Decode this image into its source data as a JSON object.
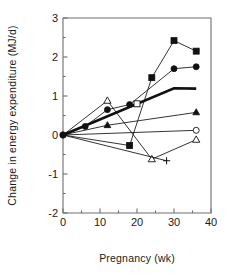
{
  "chart_data": {
    "type": "line",
    "title": "",
    "xlabel": "Pregnancy   (wk)",
    "ylabel": "Change in energy expenditure (MJ/d)",
    "xlim": [
      0,
      40
    ],
    "ylim": [
      -2,
      3
    ],
    "xticks": [
      0,
      10,
      20,
      30,
      40
    ],
    "xtick_labels": [
      "0",
      "10",
      "20",
      "30",
      "40"
    ],
    "xminor_ticks": [
      5,
      15,
      25,
      35
    ],
    "yticks": [
      -2,
      -1,
      0,
      1,
      2,
      3
    ],
    "ytick_labels": [
      "-2",
      "-1",
      "0",
      "1",
      "2",
      "3"
    ],
    "yminor_ticks": [
      -1.5,
      -0.5,
      0.5,
      1.5,
      2.5
    ],
    "grid": false,
    "legend": "none",
    "series": [
      {
        "name": "filled-square",
        "marker": "filled-square",
        "line_width": "thin",
        "x": [
          0,
          18,
          24,
          30,
          36
        ],
        "y": [
          0.0,
          -0.27,
          1.47,
          2.42,
          2.15
        ]
      },
      {
        "name": "filled-circle",
        "marker": "filled-circle",
        "line_width": "thin",
        "x": [
          0,
          6,
          12,
          18,
          30,
          36
        ],
        "y": [
          0.0,
          0.22,
          0.65,
          0.78,
          1.7,
          1.75
        ]
      },
      {
        "name": "thick-no-marker",
        "marker": "none",
        "line_width": "thick",
        "x": [
          0,
          30,
          36
        ],
        "y": [
          0.0,
          1.2,
          1.19
        ]
      },
      {
        "name": "filled-triangle",
        "marker": "filled-triangle",
        "line_width": "thin",
        "x": [
          0,
          12,
          36
        ],
        "y": [
          0.0,
          0.25,
          0.58
        ]
      },
      {
        "name": "open-square",
        "marker": "open-square",
        "line_width": "thin",
        "x": [
          0,
          20
        ],
        "y": [
          0.0,
          0.8
        ]
      },
      {
        "name": "open-triangle",
        "marker": "open-triangle",
        "line_width": "thin",
        "x": [
          0,
          12,
          24,
          36
        ],
        "y": [
          0.0,
          0.88,
          -0.62,
          -0.12
        ]
      },
      {
        "name": "open-circle",
        "marker": "open-circle",
        "line_width": "thin",
        "x": [
          0,
          36
        ],
        "y": [
          0.0,
          0.12
        ]
      },
      {
        "name": "plus",
        "marker": "plus",
        "line_width": "thin",
        "x": [
          0,
          28
        ],
        "y": [
          0.0,
          -0.66
        ]
      }
    ],
    "colors": {
      "line": "#111111",
      "axis": "#6e6e6e",
      "text": "#1a1a1a",
      "background": "#ffffff"
    }
  }
}
